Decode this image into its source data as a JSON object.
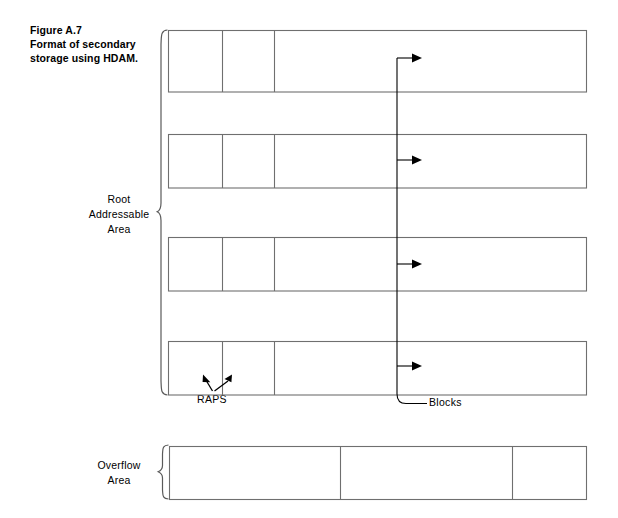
{
  "figure": {
    "caption_lines": [
      "Figure A.7",
      "Format of secondary",
      "storage using HDAM."
    ],
    "caption_full": "Figure A.7 Format of secondary storage using HDAM."
  },
  "labels": {
    "root_area": {
      "lines": [
        "Root",
        "Addressable",
        "Area"
      ],
      "text": "Root Addressable Area"
    },
    "overflow_area": {
      "lines": [
        "Overflow",
        "Area"
      ],
      "text": "Overflow Area"
    },
    "raps": "RAPS",
    "blocks": "Blocks"
  },
  "diagram": {
    "line_color": "#6b6b6b",
    "ink_color": "#000000",
    "root_addressable_area": {
      "row_count": 4,
      "rows": [
        {
          "index": 1,
          "cells": 3,
          "arrow": true
        },
        {
          "index": 2,
          "cells": 3,
          "arrow": true
        },
        {
          "index": 3,
          "cells": 3,
          "arrow": true
        },
        {
          "index": 4,
          "cells": 3,
          "arrow": true
        }
      ],
      "cell_divider_count": 2
    },
    "overflow_area": {
      "row_count": 1,
      "rows": [
        {
          "index": 1,
          "cells": 3,
          "arrow": false
        }
      ],
      "cell_divider_count": 2
    },
    "annotations": {
      "raps_pointers": 2,
      "blocks_connector": "elbow",
      "block_pointer_arrows": 4
    }
  }
}
